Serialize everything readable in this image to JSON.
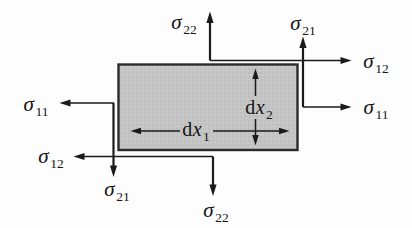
{
  "diagram": {
    "name": "2d-stress-element",
    "colors": {
      "background": "#fdfdfd",
      "element_fill": "#c5c5c5",
      "element_border": "#2b2b2b",
      "line": "#1a1a1a",
      "text": "#151515"
    },
    "labels": {
      "sigma22_top": {
        "symbol": "σ",
        "subscript": "22"
      },
      "sigma21_top": {
        "symbol": "σ",
        "subscript": "21"
      },
      "sigma12_right": {
        "symbol": "σ",
        "subscript": "12"
      },
      "sigma11_right": {
        "symbol": "σ",
        "subscript": "11"
      },
      "sigma11_left": {
        "symbol": "σ",
        "subscript": "11"
      },
      "sigma12_left": {
        "symbol": "σ",
        "subscript": "12"
      },
      "sigma21_bottom": {
        "symbol": "σ",
        "subscript": "21"
      },
      "sigma22_bottom": {
        "symbol": "σ",
        "subscript": "22"
      },
      "dx1": {
        "prefix": "d",
        "symbol": "x",
        "subscript": "1"
      },
      "dx2": {
        "prefix": "d",
        "symbol": "x",
        "subscript": "2"
      }
    }
  }
}
